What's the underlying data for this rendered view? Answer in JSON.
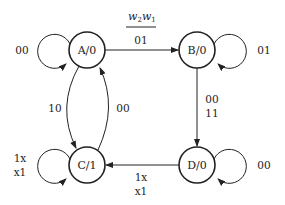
{
  "header": {
    "input_var_main": "w",
    "input_var_1_sub": "2",
    "input_var_2_sub": "1"
  },
  "states": [
    {
      "id": "A",
      "label": "A/0",
      "output": "0",
      "self_loop": "00"
    },
    {
      "id": "B",
      "label": "B/0",
      "output": "0",
      "self_loop": "01"
    },
    {
      "id": "C",
      "label": "C/1",
      "output": "1",
      "self_loop_line1": "1x",
      "self_loop_line2": "x1"
    },
    {
      "id": "D",
      "label": "D/0",
      "output": "0",
      "self_loop": "00"
    }
  ],
  "transitions": {
    "a_to_b": "01",
    "a_to_c": "10",
    "c_to_a": "00",
    "b_to_d_line1": "00",
    "b_to_d_line2": "11",
    "d_to_c_line1": "1x",
    "d_to_c_line2": "x1"
  }
}
